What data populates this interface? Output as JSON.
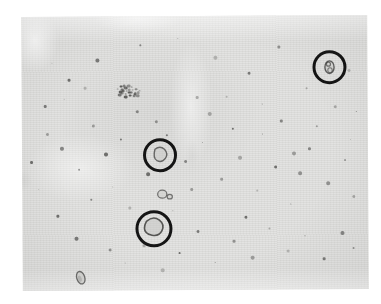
{
  "figure": {
    "kind": "photomicrograph",
    "caption": "",
    "media": "light microscopy field, unstained wet mount",
    "background_color": "#e2e2e0",
    "page_color": "#ffffff",
    "annotation_color": "#151515",
    "field": {
      "x": 22,
      "y": 16,
      "width": 346,
      "height": 274,
      "rotation_deg": -0.35
    }
  },
  "annotations": {
    "circle_color": "#151515",
    "circle_stroke_px": 3,
    "items": [
      {
        "label": "",
        "name": "annotation-circle-top-right",
        "cx": 330,
        "cy": 68,
        "d": 34
      },
      {
        "label": "",
        "name": "annotation-circle-middle",
        "cx": 160,
        "cy": 155,
        "d": 34
      },
      {
        "label": "",
        "name": "annotation-circle-lower",
        "cx": 154,
        "cy": 228,
        "d": 37
      }
    ]
  },
  "objects": {
    "circled_cells": [
      {
        "name": "cell-top-right",
        "cx": 330,
        "cy": 68,
        "w": 11,
        "h": 14
      },
      {
        "name": "cell-middle",
        "cx": 160,
        "cy": 155,
        "w": 13,
        "h": 14
      },
      {
        "name": "cell-lower",
        "cx": 153,
        "cy": 228,
        "w": 16,
        "h": 15
      }
    ],
    "uncircled_cells": [
      {
        "name": "cell-budding-yeast",
        "cx": 162,
        "cy": 194,
        "w": 12,
        "h": 8
      },
      {
        "name": "cell-bottom-left",
        "cx": 80,
        "cy": 277,
        "w": 8,
        "h": 13
      },
      {
        "name": "debris-cluster",
        "cx": 128,
        "cy": 90,
        "w": 26,
        "h": 17
      }
    ],
    "speck_count": 72
  },
  "specks": [
    [
      52,
      62
    ],
    [
      68,
      78
    ],
    [
      96,
      58
    ],
    [
      140,
      44
    ],
    [
      155,
      120
    ],
    [
      178,
      38
    ],
    [
      196,
      96
    ],
    [
      214,
      56
    ],
    [
      232,
      128
    ],
    [
      248,
      72
    ],
    [
      262,
      104
    ],
    [
      278,
      46
    ],
    [
      292,
      152
    ],
    [
      306,
      88
    ],
    [
      348,
      70
    ],
    [
      356,
      112
    ],
    [
      44,
      104
    ],
    [
      60,
      146
    ],
    [
      78,
      168
    ],
    [
      92,
      124
    ],
    [
      112,
      186
    ],
    [
      128,
      206
    ],
    [
      146,
      172
    ],
    [
      166,
      134
    ],
    [
      184,
      160
    ],
    [
      202,
      142
    ],
    [
      220,
      178
    ],
    [
      238,
      156
    ],
    [
      256,
      190
    ],
    [
      274,
      166
    ],
    [
      290,
      204
    ],
    [
      308,
      148
    ],
    [
      326,
      182
    ],
    [
      344,
      160
    ],
    [
      352,
      196
    ],
    [
      38,
      188
    ],
    [
      56,
      214
    ],
    [
      74,
      236
    ],
    [
      90,
      198
    ],
    [
      108,
      248
    ],
    [
      124,
      262
    ],
    [
      142,
      244
    ],
    [
      160,
      268
    ],
    [
      178,
      252
    ],
    [
      196,
      230
    ],
    [
      214,
      262
    ],
    [
      232,
      240
    ],
    [
      250,
      256
    ],
    [
      268,
      228
    ],
    [
      286,
      250
    ],
    [
      304,
      236
    ],
    [
      322,
      258
    ],
    [
      340,
      232
    ],
    [
      352,
      248
    ],
    [
      46,
      132
    ],
    [
      64,
      98
    ],
    [
      84,
      86
    ],
    [
      104,
      152
    ],
    [
      120,
      138
    ],
    [
      136,
      110
    ],
    [
      172,
      210
    ],
    [
      190,
      188
    ],
    [
      208,
      112
    ],
    [
      226,
      96
    ],
    [
      244,
      216
    ],
    [
      262,
      134
    ],
    [
      280,
      120
    ],
    [
      298,
      172
    ],
    [
      316,
      126
    ],
    [
      334,
      106
    ],
    [
      350,
      140
    ],
    [
      30,
      160
    ]
  ]
}
